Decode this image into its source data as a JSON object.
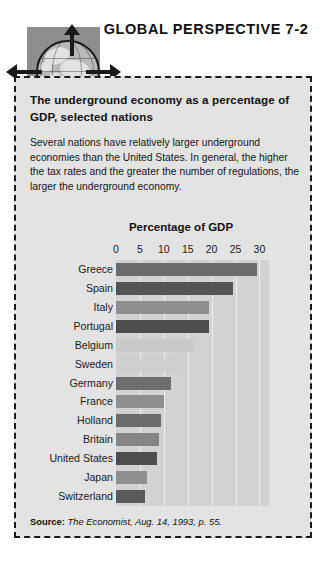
{
  "header": {
    "title": "GLOBAL PERSPECTIVE 7-2",
    "icon": "globe-icon"
  },
  "box": {
    "title": "The underground economy as a percentage of GDP, selected nations",
    "body": "Several nations have relatively larger underground economies than the United States. In general, the higher the tax rates and the greater the number of regulations, the larger the underground economy."
  },
  "source": {
    "label": "Source:",
    "text": "The Economist, Aug. 14, 1993, p. 55."
  },
  "chart_data": {
    "type": "bar",
    "orientation": "horizontal",
    "title": "Percentage of GDP",
    "xlabel": "Percentage of GDP",
    "ylabel": "",
    "xlim": [
      0,
      32
    ],
    "ticks": [
      0,
      5,
      10,
      15,
      20,
      25,
      30
    ],
    "grid": true,
    "legend": "none",
    "categories": [
      "Greece",
      "Spain",
      "Italy",
      "Portugal",
      "Belgium",
      "Sweden",
      "Germany",
      "France",
      "Holland",
      "Britain",
      "United States",
      "Japan",
      "Switzerland"
    ],
    "values": [
      29.5,
      24.5,
      19.5,
      19.5,
      16,
      14,
      11.5,
      10,
      9.5,
      9,
      8.5,
      6.5,
      6
    ],
    "bar_colors": [
      "#6b6b6b",
      "#545454",
      "#8f8f8f",
      "#4d4d4d",
      "#c9c9c9",
      "#cfcfcf",
      "#6e6e6e",
      "#8f8f8f",
      "#6b6b6b",
      "#858585",
      "#4d4d4d",
      "#8f8f8f",
      "#5a5a5a"
    ]
  },
  "colors": {
    "panel_bg": "#e3e3e3",
    "plot_bg": "#d2d2d2",
    "border": "#1a1a1a",
    "text": "#111111"
  }
}
